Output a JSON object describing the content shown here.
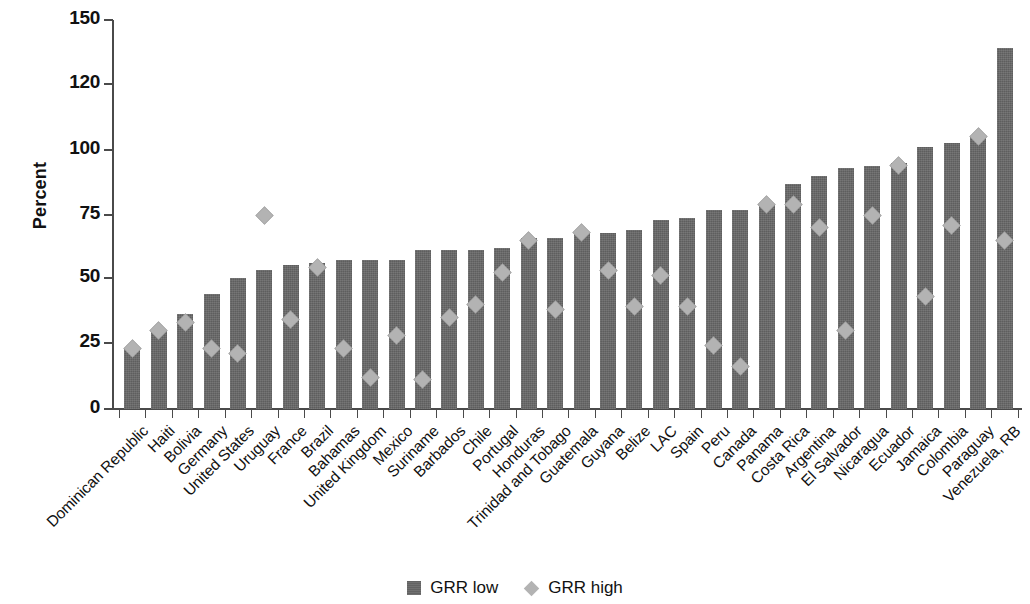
{
  "chart_data": {
    "type": "bar",
    "title": "",
    "subtitle": "",
    "xlabel": "",
    "ylabel": "Percent",
    "ylim": [
      0,
      150
    ],
    "yticks": [
      0,
      25,
      50,
      75,
      100,
      120,
      150
    ],
    "ytick_labels": [
      "0",
      "25",
      "50",
      "75",
      "100",
      "120",
      "150"
    ],
    "grid": false,
    "legend_position": "bottom-center",
    "categories": [
      "Dominican Republic",
      "Haiti",
      "Bolivia",
      "Germany",
      "United States",
      "Uruguay",
      "France",
      "Brazil",
      "Bahamas",
      "United Kingdom",
      "Mexico",
      "Suriname",
      "Barbados",
      "Chile",
      "Portugal",
      "Honduras",
      "Trinidad and Tobago",
      "Guatemala",
      "Guyana",
      "Belize",
      "LAC",
      "Spain",
      "Peru",
      "Canada",
      "Panama",
      "Costa Rica",
      "Argentina",
      "El Salvador",
      "Nicaragua",
      "Ecuador",
      "Jamaica",
      "Colombia",
      "Paraguay",
      "Venezuela, RB"
    ],
    "series": [
      {
        "name": "GRR low",
        "type": "bar",
        "color": "#676767",
        "values": [
          23,
          30,
          36,
          44,
          50,
          53,
          55,
          56,
          57,
          57,
          57,
          61,
          61,
          61,
          62,
          66,
          66,
          68,
          68,
          69,
          73,
          74,
          77,
          77,
          79,
          87,
          90,
          93,
          94,
          95,
          101,
          102,
          104,
          137
        ]
      },
      {
        "name": "GRR high",
        "type": "scatter",
        "marker": "diamond",
        "color": "#b3b3b3",
        "values": [
          23,
          30,
          33,
          23,
          21,
          75,
          34,
          54,
          23,
          12,
          28,
          11,
          35,
          40,
          52,
          65,
          38,
          68,
          53,
          39,
          51,
          39,
          24,
          16,
          79,
          79,
          70,
          30,
          75,
          94,
          43,
          71,
          104,
          65
        ]
      }
    ]
  },
  "legend": {
    "items": [
      {
        "label": "GRR low",
        "marker": "square",
        "color": "#676767"
      },
      {
        "label": "GRR high",
        "marker": "diamond",
        "color": "#b3b3b3"
      }
    ]
  },
  "axis": {
    "y_title": "Percent"
  }
}
